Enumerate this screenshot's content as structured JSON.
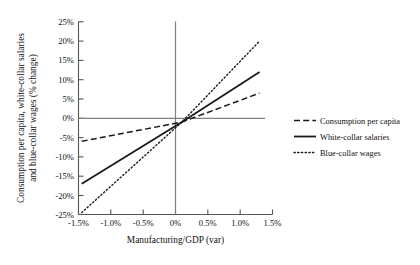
{
  "chart_data": {
    "type": "line",
    "title": "",
    "xlabel": "Manufacturing/GDP (var)",
    "ylabel": "Consumption per capita, white-collar salaries and blue-collar wages (% change)",
    "ylabel_line1": "Consumption per capita, white-collar salaries",
    "ylabel_line2": "and blue-collar wages (% change)",
    "xlim": [
      -1.5,
      1.5
    ],
    "ylim": [
      -25,
      25
    ],
    "xticks": [
      -1.5,
      -1.0,
      -0.5,
      0,
      0.5,
      1.0,
      1.5
    ],
    "xticklabels": [
      "-1.5%",
      "-1.0%",
      "-0.5%",
      "0%",
      "0.5%",
      "1.0%",
      "1.5%"
    ],
    "yticks": [
      -25,
      -20,
      -15,
      -10,
      -5,
      0,
      5,
      10,
      15,
      20,
      25
    ],
    "yticklabels": [
      "-25%",
      "-20%",
      "-15%",
      "-10%",
      "-5%",
      "0%",
      "5%",
      "10%",
      "15%",
      "20%",
      "25%"
    ],
    "grid": false,
    "legend_position": "right",
    "zero_lines": {
      "horizontal": 0,
      "vertical": 0
    },
    "x_data_range": [
      -1.45,
      1.3
    ],
    "series": [
      {
        "name": "Consumption per capita",
        "style": "dashed",
        "color": "#1a1a1a",
        "x": [
          -1.45,
          0.1,
          1.3
        ],
        "values": [
          -6.0,
          -1.0,
          6.5
        ]
      },
      {
        "name": "White-collar salaries",
        "style": "solid",
        "color": "#1a1a1a",
        "x": [
          -1.45,
          0.1,
          1.3
        ],
        "values": [
          -17.0,
          -1.0,
          12.0
        ]
      },
      {
        "name": "Blue-collar wages",
        "style": "dotted",
        "color": "#1a1a1a",
        "x": [
          -1.45,
          0.1,
          1.3
        ],
        "values": [
          -24.5,
          -1.0,
          20.0
        ]
      }
    ]
  },
  "legend": {
    "items": [
      {
        "label": "Consumption per capita"
      },
      {
        "label": "White-collar salaries"
      },
      {
        "label": "Blue-collar wages"
      }
    ]
  },
  "colors": {
    "ink": "#1a1a1a",
    "axis": "#808080",
    "frame": "#555555",
    "background": "#ffffff"
  }
}
